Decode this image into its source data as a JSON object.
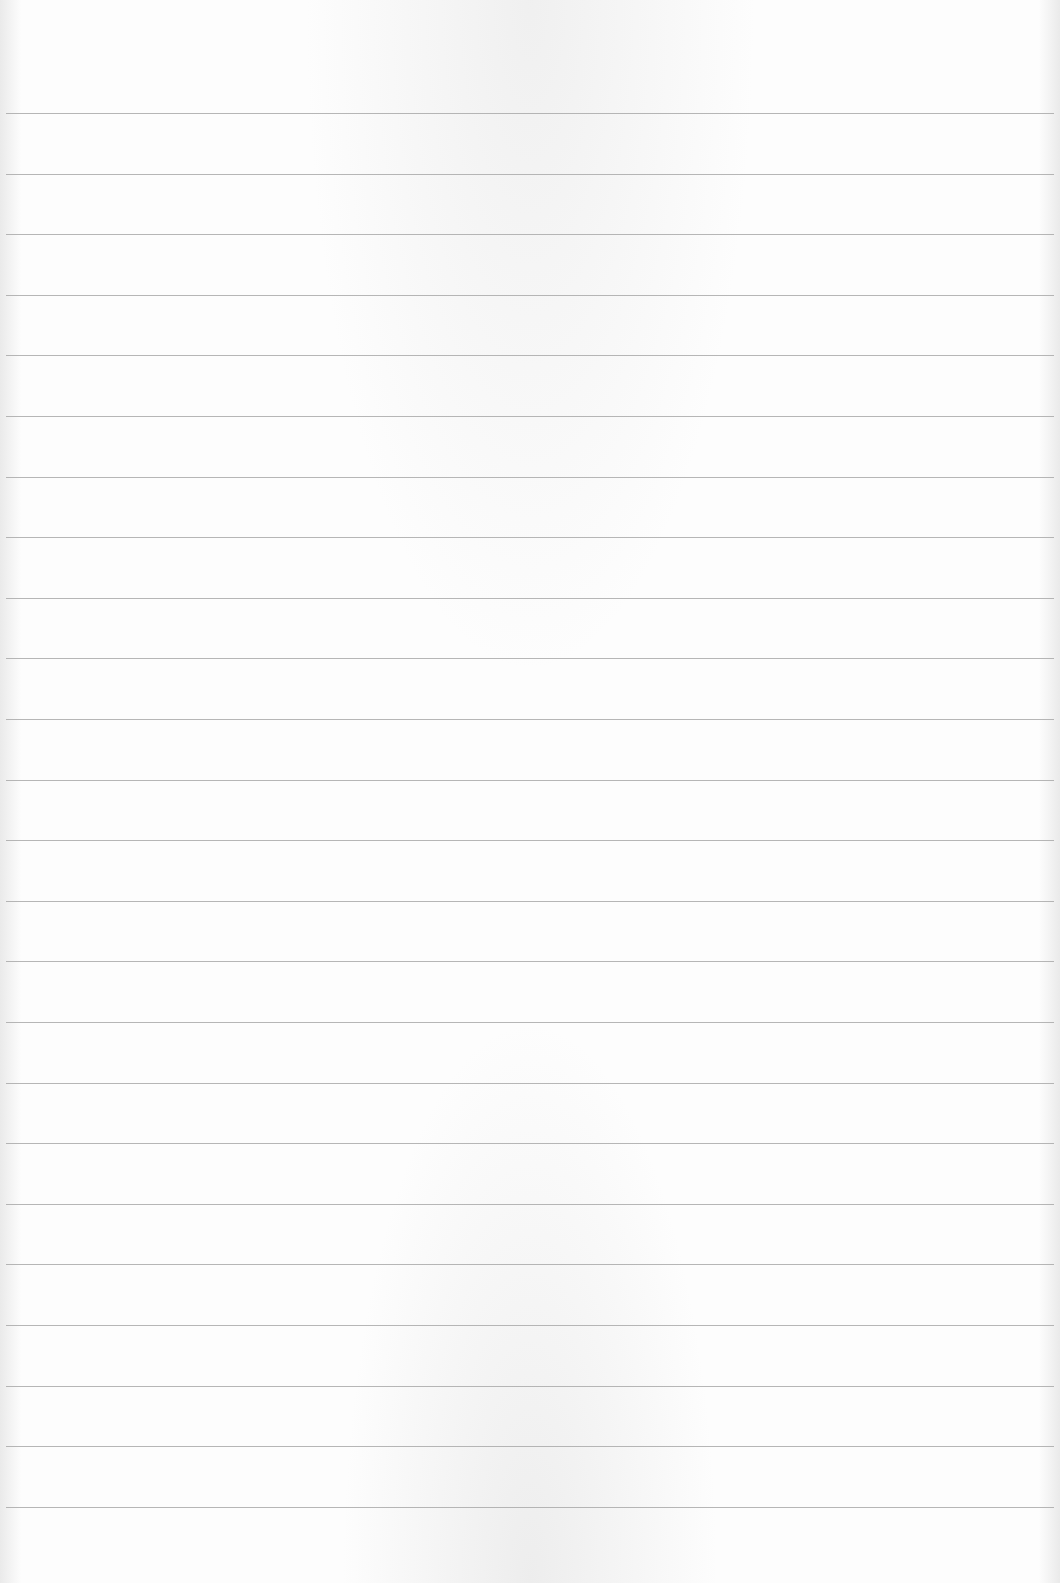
{
  "page": {
    "type": "lined-paper",
    "background_color": "#fdfdfd",
    "rule_color": "#a9a9a9",
    "rule_count": 24,
    "first_rule_y": 113,
    "rule_spacing": 60.6,
    "text": []
  }
}
